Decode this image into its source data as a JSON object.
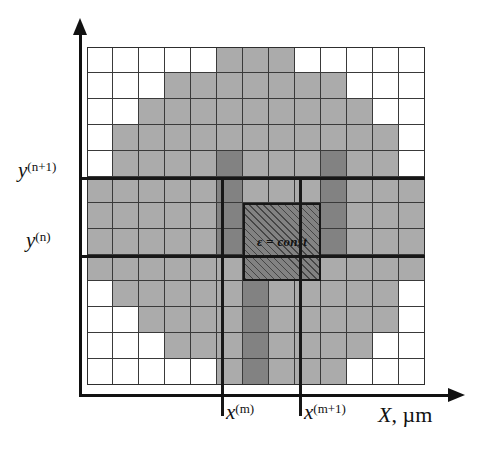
{
  "figure": {
    "axes": {
      "x_axis_label": "X, µm",
      "x_axis_variable": "X",
      "x_axis_unit": "µm",
      "y_axis_label": "",
      "x_ticks": [
        {
          "id": "x-m",
          "var": "x",
          "sup": "(m)",
          "sup_plain": "(m)"
        },
        {
          "id": "x-m1",
          "var": "x",
          "sup": "(m+1)",
          "sup_plain": "(m+1)"
        }
      ],
      "y_ticks": [
        {
          "id": "y-n1",
          "var": "y",
          "sup": "(n+1)",
          "sup_plain": "(n+1)"
        },
        {
          "id": "y-n",
          "var": "y",
          "sup": "(n)",
          "sup_plain": "(n)"
        }
      ]
    },
    "cell_annotation": {
      "text": "ε = const",
      "symbol": "ε",
      "relation": "=",
      "value": "const"
    },
    "colors": {
      "background": "#ffffff",
      "cell_empty": "#ffffff",
      "cell_light_gray": "#ababab",
      "cell_dark_gray": "#828282",
      "grid_line": "#3a3a3a",
      "axis": "#111111",
      "marker_line": "#171717",
      "hatch": "#141414"
    }
  },
  "chart_data": {
    "type": "heatmap",
    "xlabel": "X, µm",
    "ylabel": "",
    "grid": true,
    "legend": "none",
    "n_cols": 13,
    "n_rows": 13,
    "cell_size_px": 26,
    "value_legend": {
      "0": "empty (white) — outside structure",
      "1": "light gray — medium region",
      "2": "dark gray — high-permittivity region"
    },
    "highlighted_cell": {
      "col": 6,
      "row": 6,
      "label": "ε = const",
      "fill": "hatched"
    },
    "marker_lines": {
      "vertical": [
        {
          "label": "x^(m)",
          "col_boundary": 5
        },
        {
          "label": "x^(m+1)",
          "col_boundary": 8
        }
      ],
      "horizontal": [
        {
          "label": "y^(n+1)",
          "row_boundary": 5
        },
        {
          "label": "y^(n)",
          "row_boundary": 8
        }
      ]
    },
    "values": [
      [
        0,
        0,
        0,
        0,
        0,
        1,
        1,
        1,
        0,
        0,
        0,
        0,
        0
      ],
      [
        0,
        0,
        0,
        1,
        1,
        1,
        1,
        1,
        1,
        1,
        0,
        0,
        0
      ],
      [
        0,
        0,
        1,
        1,
        1,
        1,
        1,
        1,
        1,
        1,
        1,
        0,
        0
      ],
      [
        0,
        1,
        1,
        1,
        1,
        1,
        1,
        1,
        1,
        1,
        1,
        1,
        0
      ],
      [
        0,
        1,
        1,
        1,
        1,
        2,
        1,
        1,
        1,
        2,
        1,
        1,
        0
      ],
      [
        1,
        1,
        1,
        1,
        1,
        2,
        1,
        1,
        1,
        2,
        1,
        1,
        1
      ],
      [
        1,
        1,
        1,
        1,
        1,
        2,
        2,
        2,
        1,
        2,
        1,
        1,
        1
      ],
      [
        1,
        1,
        1,
        1,
        1,
        2,
        2,
        2,
        1,
        2,
        1,
        1,
        1
      ],
      [
        1,
        1,
        1,
        1,
        1,
        1,
        2,
        1,
        1,
        1,
        1,
        1,
        1
      ],
      [
        0,
        1,
        1,
        1,
        1,
        1,
        2,
        1,
        1,
        1,
        1,
        1,
        0
      ],
      [
        0,
        0,
        1,
        1,
        1,
        1,
        2,
        1,
        1,
        1,
        1,
        1,
        0
      ],
      [
        0,
        0,
        0,
        1,
        1,
        1,
        2,
        1,
        1,
        1,
        1,
        0,
        0
      ],
      [
        0,
        0,
        0,
        0,
        0,
        1,
        2,
        1,
        1,
        1,
        0,
        0,
        0
      ]
    ]
  }
}
